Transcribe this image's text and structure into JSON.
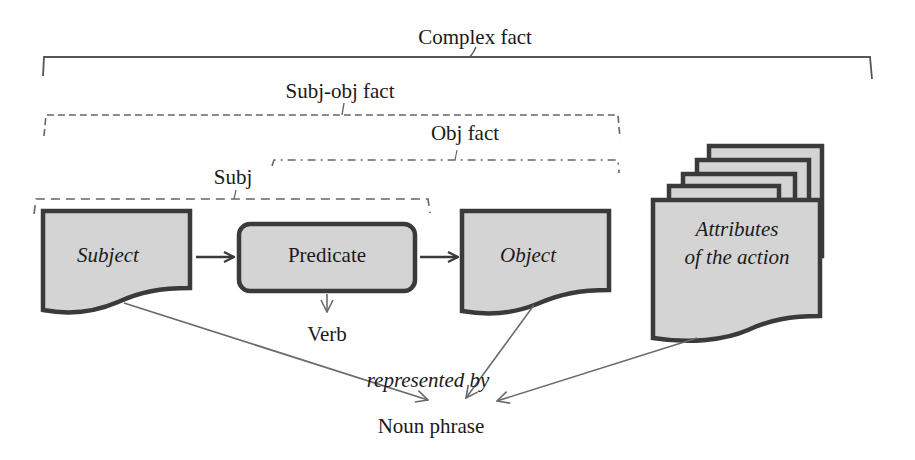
{
  "diagram": {
    "title": "Complex fact",
    "groups": {
      "complex_fact": "Complex fact",
      "subj_obj_fact": "Subj-obj fact",
      "obj_fact": "Obj fact",
      "subj": "Subj"
    },
    "nodes": {
      "subject": "Subject",
      "predicate": "Predicate",
      "object": "Object",
      "attributes_line1": "Attributes",
      "attributes_line2": "of the action",
      "verb": "Verb",
      "noun_phrase": "Noun phrase"
    },
    "edge_labels": {
      "represented_by": "represented by"
    },
    "edges": [
      {
        "from": "Subject",
        "to": "Predicate"
      },
      {
        "from": "Predicate",
        "to": "Object"
      },
      {
        "from": "Predicate",
        "to": "Verb"
      },
      {
        "from": "Subject",
        "to": "Noun phrase"
      },
      {
        "from": "Object",
        "to": "Noun phrase"
      },
      {
        "from": "Attributes of the action",
        "to": "Noun phrase"
      }
    ],
    "colors": {
      "shape_fill": "#d4d4d4",
      "shape_stroke": "#3a3a3a",
      "connector": "#6a6a6a",
      "bracket": "#555555",
      "text": "#1a1a1a"
    }
  }
}
